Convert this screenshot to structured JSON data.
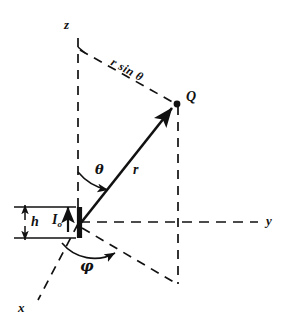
{
  "figure": {
    "type": "spherical-coordinate-diagram",
    "background_color": "#ffffff",
    "ink_color": "#111111"
  },
  "axes": [
    {
      "name": "z-axis",
      "label": "z",
      "direction": "up",
      "style": "dashed"
    },
    {
      "name": "y-axis",
      "label": "y",
      "direction": "right",
      "style": "dashed"
    },
    {
      "name": "x-axis",
      "label": "x",
      "direction": "lower-left",
      "style": "dashed"
    }
  ],
  "points": [
    {
      "name": "origin",
      "label": ""
    },
    {
      "name": "field-point",
      "label": "Q",
      "marker": "filled-dot"
    }
  ],
  "labels": {
    "z_axis": "z",
    "y_axis": "y",
    "x_axis": "x",
    "point_q": "Q",
    "radius": "r",
    "theta": "θ",
    "phi": "φ",
    "r_sin_theta": "r sin θ",
    "height": "h",
    "current_symbol": "I",
    "current_subscript": "o"
  },
  "segments": [
    {
      "name": "radius-vector",
      "from": "origin",
      "to": "field-point",
      "style": "solid",
      "arrow": true,
      "label": "r"
    },
    {
      "name": "r-sin-theta-line",
      "from": "z-axis",
      "to": "field-point",
      "style": "dashed",
      "label": "r sin θ"
    },
    {
      "name": "drop-line",
      "from": "field-point",
      "to": "xy-projection",
      "style": "dashed"
    },
    {
      "name": "projection-line",
      "from": "origin",
      "to": "xy-projection",
      "style": "dashed"
    },
    {
      "name": "dipole-element",
      "orientation": "vertical",
      "style": "thick-solid"
    }
  ],
  "angles": [
    {
      "name": "theta-arc",
      "label": "θ",
      "from": "z-axis",
      "to": "radius-vector"
    },
    {
      "name": "phi-arc",
      "label": "φ",
      "from": "x-axis",
      "to": "projection-line"
    }
  ],
  "dimension": {
    "name": "height-dimension",
    "label": "h",
    "style": "double-headed-arrow-with-extension-lines"
  },
  "current": {
    "name": "current-arrow",
    "label": "I",
    "subscript": "o",
    "direction": "up"
  }
}
